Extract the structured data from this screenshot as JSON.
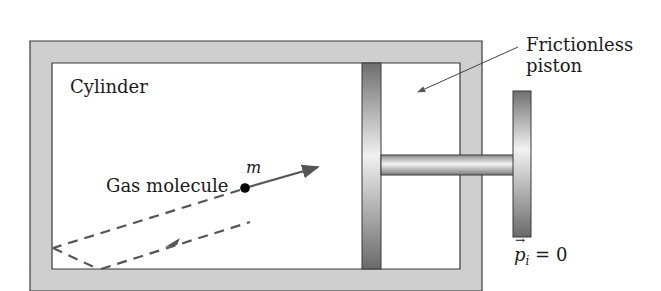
{
  "diagram": {
    "type": "physics-schematic",
    "labels": {
      "cylinder": "Cylinder",
      "piston_line1": "Frictionless",
      "piston_line2": "piston",
      "molecule": "Gas molecule",
      "mass": "m",
      "momentum_symbol": "p",
      "momentum_arrow": "→",
      "momentum_subscript": "i",
      "momentum_value": " = 0"
    },
    "colors": {
      "wall_fill": "#cfcfcf",
      "outline": "#3a3a3a",
      "piston_dark": "#6e6e6e",
      "piston_light": "#f2f2f2",
      "path": "#555555",
      "molecule": "#000000"
    }
  }
}
